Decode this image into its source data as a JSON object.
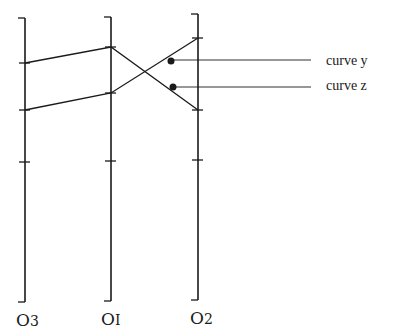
{
  "diagram": {
    "axes": [
      {
        "id": "O3",
        "label": "O3",
        "label_main": "O",
        "label_sub": "3",
        "x": 25,
        "top": 18,
        "bottom": 302,
        "ticks": [
          63,
          110,
          162
        ]
      },
      {
        "id": "O1",
        "label": "O1",
        "label_main": "O",
        "label_sub": "I",
        "x": 111,
        "top": 17,
        "bottom": 301,
        "ticks": [
          47,
          93,
          161
        ]
      },
      {
        "id": "O2",
        "label": "O2",
        "label_main": "O",
        "label_sub": "2",
        "x": 198,
        "top": 14,
        "bottom": 300,
        "ticks": [
          38,
          110,
          160
        ]
      }
    ],
    "curves": [
      {
        "name": "curve y",
        "label": "curve y",
        "points": [
          [
            25,
            63
          ],
          [
            111,
            47
          ],
          [
            198,
            110
          ]
        ],
        "marker": [
          171,
          61
        ],
        "leader_y": 60
      },
      {
        "name": "curve z",
        "label": "curve z",
        "points": [
          [
            25,
            110
          ],
          [
            111,
            93
          ],
          [
            198,
            38
          ]
        ],
        "marker": [
          173,
          87
        ],
        "leader_y": 87
      }
    ],
    "leader_end_x": 311,
    "label_x": 326,
    "stroke_color": "#1a1a1a",
    "background": "#ffffff"
  }
}
